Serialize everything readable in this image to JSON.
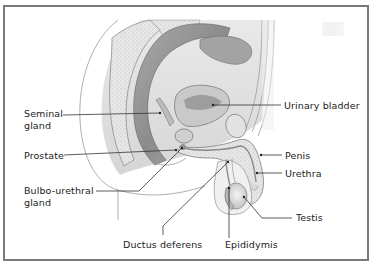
{
  "diagram": {
    "type": "anatomical-illustration",
    "colors": {
      "frame": "#7a7a7a",
      "leader_line": "#333333",
      "tissue_light": "#e6e6e6",
      "tissue_mid": "#bdbdbd",
      "tissue_dark": "#8f8f8f",
      "label_text": "#222222"
    },
    "labels": {
      "seminal_gland_line1": "Seminal",
      "seminal_gland_line2": "gland",
      "prostate": "Prostate",
      "bulbo_urethral_line1": "Bulbo-urethral",
      "bulbo_urethral_line2": "gland",
      "ductus_deferens": "Ductus deferens",
      "epididymis": "Epididymis",
      "testis": "Testis",
      "urethra": "Urethra",
      "penis": "Penis",
      "urinary_bladder": "Urinary bladder"
    }
  }
}
